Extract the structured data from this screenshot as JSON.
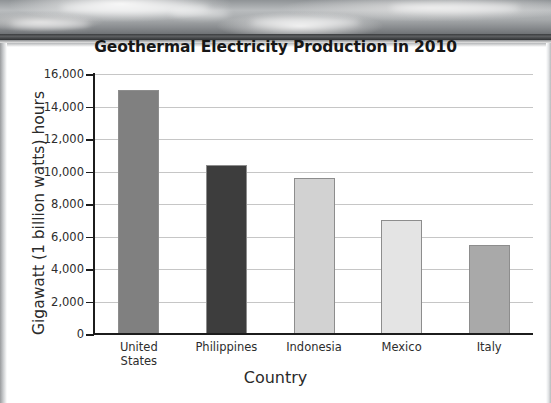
{
  "chart_data": {
    "type": "bar",
    "title": "Geothermal Electricity Production in 2010",
    "xlabel": "Country",
    "ylabel": "Gigawatt (1 billion watts) hours",
    "categories": [
      "United States",
      "Philippines",
      "Indonesia",
      "Mexico",
      "Italy"
    ],
    "category_lines": [
      [
        "United",
        "States"
      ],
      [
        "Philippines"
      ],
      [
        "Indonesia"
      ],
      [
        "Mexico"
      ],
      [
        "Italy"
      ]
    ],
    "values": [
      15000,
      10400,
      9600,
      7000,
      5500
    ],
    "bar_colors": [
      "#808080",
      "#3d3d3d",
      "#d2d2d2",
      "#e4e4e4",
      "#a9a9a9"
    ],
    "ylim": [
      0,
      16000
    ],
    "ytick_values": [
      0,
      2000,
      4000,
      6000,
      8000,
      10000,
      12000,
      14000,
      16000
    ],
    "ytick_labels": [
      "0",
      "2,000",
      "4,000",
      "6,000",
      "8,000",
      "10,000",
      "12,000",
      "14,000",
      "16,000"
    ],
    "grid": true,
    "grid_axis": "y",
    "legend": "none",
    "bar_edge_color": "#8d8d8d",
    "axis_color": "#1c1c1c",
    "gridline_color": "#c6c6c6"
  }
}
